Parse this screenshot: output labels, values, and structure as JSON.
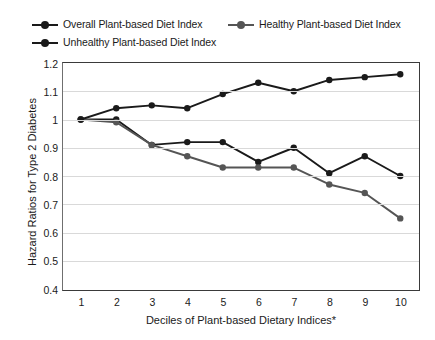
{
  "chart_data": {
    "type": "line",
    "title": "",
    "xlabel": "Deciles of Plant-based Dietary Indices*",
    "ylabel": "Hazard Ratios for Type 2 Diabetes",
    "categories": [
      "1",
      "2",
      "3",
      "4",
      "5",
      "6",
      "7",
      "8",
      "9",
      "10"
    ],
    "x": [
      1,
      2,
      3,
      4,
      5,
      6,
      7,
      8,
      9,
      10
    ],
    "ylim": [
      0.4,
      1.2
    ],
    "ytick_step": 0.1,
    "yticks": [
      "1.2",
      "1.1",
      "1",
      "0.9",
      "0.8",
      "0.7",
      "0.6",
      "0.5",
      "0.4"
    ],
    "grid": "horizontal",
    "legend_position": "top",
    "series": [
      {
        "name": "Overall Plant-based Diet Index",
        "color": "#1a1a1a",
        "marker": "circle",
        "values": [
          1.0,
          1.0,
          0.91,
          0.92,
          0.92,
          0.85,
          0.9,
          0.81,
          0.87,
          0.8
        ]
      },
      {
        "name": "Healthy Plant-based Diet Index",
        "color": "#555555",
        "marker": "circle",
        "values": [
          1.0,
          0.99,
          0.91,
          0.87,
          0.83,
          0.83,
          0.83,
          0.77,
          0.74,
          0.65
        ]
      },
      {
        "name": "Unhealthy Plant-based Diet Index",
        "color": "#1a1a1a",
        "marker": "circle",
        "values": [
          1.0,
          1.04,
          1.05,
          1.04,
          1.09,
          1.13,
          1.1,
          1.14,
          1.15,
          1.16
        ]
      }
    ]
  },
  "legend": {
    "items": [
      {
        "label": "Overall Plant-based Diet Index",
        "color": "#1a1a1a"
      },
      {
        "label": "Healthy Plant-based Diet Index",
        "color": "#555555"
      },
      {
        "label": "Unhealthy Plant-based Diet Index",
        "color": "#1a1a1a"
      }
    ]
  },
  "colors": {
    "background": "#ffffff",
    "grid": "#d9d9d9",
    "axis": "#3a3a3a",
    "text": "#1a1a1a"
  }
}
